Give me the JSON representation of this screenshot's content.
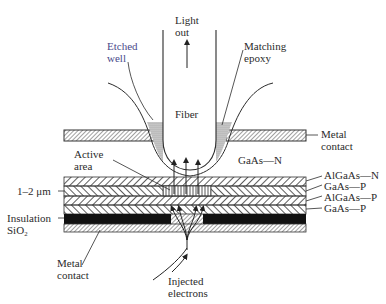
{
  "diagram": {
    "labels": {
      "light_out": [
        "Light",
        "out"
      ],
      "etched_well": [
        "Etched",
        "well"
      ],
      "matching_epoxy": [
        "Matching",
        "epoxy"
      ],
      "fiber": "Fiber",
      "metal_contact_top": [
        "Metal",
        "contact"
      ],
      "gaas_n": "GaAs—N",
      "active_area": [
        "Active",
        "area"
      ],
      "thickness": "1–2 μm",
      "insulation": [
        "Insulation",
        "SiO₂"
      ],
      "metal_contact_bottom": [
        "Metal",
        "contact"
      ],
      "injected_electrons": [
        "Injected",
        "electrons"
      ]
    },
    "layers": [
      {
        "name": "AlGaAs—N"
      },
      {
        "name": "GaAs—P"
      },
      {
        "name": "AlGaAs—P"
      },
      {
        "name": "GaAs—P"
      }
    ],
    "colors": {
      "line": "#2b2b2b",
      "hatch": "#3a3a3a",
      "insulation": "#111111",
      "epoxy": "#b8b8b8",
      "etched_well_label": "#4a4a8a"
    }
  }
}
